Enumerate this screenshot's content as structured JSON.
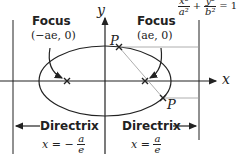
{
  "equation": {
    "lhs_1": "x²",
    "den_1": "a²",
    "plus": "+",
    "lhs_2": "y²",
    "den_2": "b²",
    "equals": "= 1"
  },
  "axes": {
    "x_label": "x",
    "y_label": "y"
  },
  "foci": [
    {
      "title": "Focus",
      "coord": "(−ae, 0)"
    },
    {
      "title": "Focus",
      "coord": "(ae, 0)"
    }
  ],
  "points": [
    {
      "label": "P"
    },
    {
      "label": "P"
    }
  ],
  "directrices": [
    {
      "title": "Directrix",
      "eq_prefix": "x = −",
      "num": "a",
      "den": "e"
    },
    {
      "title": "Directrix",
      "eq_prefix": "x =",
      "num": "a",
      "den": "e"
    }
  ],
  "colors": {
    "line": "#222222",
    "guide": "#999999"
  }
}
